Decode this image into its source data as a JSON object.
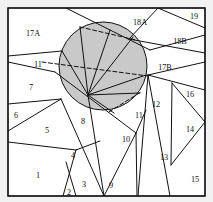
{
  "figure": {
    "type": "diagram",
    "title": "",
    "canvas": {
      "width": 213,
      "height": 202,
      "background": "#f2f2f2"
    },
    "frame": {
      "x": 8,
      "y": 8,
      "width": 197,
      "height": 188,
      "stroke": "#111111",
      "fill": "#ffffff"
    },
    "colors": {
      "line": "#111111",
      "shade_fill": "#c9c9c9",
      "page_fill": "#ffffff",
      "background": "#f2f2f2",
      "label_text": "#111111"
    },
    "shaded_region": {
      "name": "shaded-disk",
      "shape": "circle",
      "center_x": 103,
      "center_y": 66,
      "radius": 44,
      "fill": "#c9c9c9"
    },
    "fan": {
      "name": "radial-fan",
      "origin_x": 88,
      "origin_y": 95,
      "ray_endpoints": [
        [
          62,
          51
        ],
        [
          80,
          27
        ],
        [
          110,
          30
        ],
        [
          133,
          37
        ],
        [
          146,
          75
        ],
        [
          140,
          93
        ],
        [
          114,
          113
        ]
      ]
    },
    "dashed_lines": [
      {
        "name": "chord-upper",
        "x1": 80,
        "y1": 27,
        "x2": 136,
        "y2": 40
      },
      {
        "name": "chord-mid",
        "x1": 42,
        "y1": 62,
        "x2": 148,
        "y2": 76
      },
      {
        "name": "chord-lower",
        "x1": 109,
        "y1": 112,
        "x2": 141,
        "y2": 92
      }
    ],
    "labels": [
      {
        "id": "label-17A",
        "text": "17A",
        "x": 33,
        "y": 34
      },
      {
        "id": "label-18A",
        "text": "18A",
        "x": 140,
        "y": 23
      },
      {
        "id": "label-19",
        "text": "19",
        "x": 194,
        "y": 17
      },
      {
        "id": "label-18B",
        "text": "18B",
        "x": 180,
        "y": 42
      },
      {
        "id": "label-17B",
        "text": "17B",
        "x": 165,
        "y": 68
      },
      {
        "id": "label-11a",
        "text": "11",
        "x": 38,
        "y": 65
      },
      {
        "id": "label-7",
        "text": "7",
        "x": 31,
        "y": 88
      },
      {
        "id": "label-16",
        "text": "16",
        "x": 190,
        "y": 95
      },
      {
        "id": "label-12",
        "text": "12",
        "x": 156,
        "y": 105
      },
      {
        "id": "label-11b",
        "text": "11",
        "x": 139,
        "y": 116
      },
      {
        "id": "label-6",
        "text": "6",
        "x": 16,
        "y": 116
      },
      {
        "id": "label-8",
        "text": "8",
        "x": 83,
        "y": 122
      },
      {
        "id": "label-14",
        "text": "14",
        "x": 190,
        "y": 130
      },
      {
        "id": "label-5",
        "text": "5",
        "x": 47,
        "y": 131
      },
      {
        "id": "label-10",
        "text": "10",
        "x": 126,
        "y": 140
      },
      {
        "id": "label-13",
        "text": "13",
        "x": 164,
        "y": 158
      },
      {
        "id": "label-4",
        "text": "4",
        "x": 73,
        "y": 156
      },
      {
        "id": "label-1",
        "text": "1",
        "x": 38,
        "y": 176
      },
      {
        "id": "label-15",
        "text": "15",
        "x": 195,
        "y": 180
      },
      {
        "id": "label-3",
        "text": "3",
        "x": 84,
        "y": 185
      },
      {
        "id": "label-9",
        "text": "9",
        "x": 111,
        "y": 186
      },
      {
        "id": "label-2",
        "text": "2",
        "x": 69,
        "y": 193
      }
    ],
    "solid_edges": [
      {
        "name": "e-top-left-diag",
        "x1": 8,
        "y1": 8,
        "x2": 8,
        "y2": 8
      },
      {
        "name": "e1",
        "x1": 66,
        "y1": 8,
        "x2": 150,
        "y2": 50
      },
      {
        "name": "e2",
        "x1": 8,
        "y1": 56,
        "x2": 62,
        "y2": 51
      },
      {
        "name": "e3",
        "x1": 8,
        "y1": 62,
        "x2": 55,
        "y2": 72
      },
      {
        "name": "e4",
        "x1": 55,
        "y1": 72,
        "x2": 136,
        "y2": 133
      },
      {
        "name": "e5",
        "x1": 8,
        "y1": 104,
        "x2": 61,
        "y2": 99
      },
      {
        "name": "e6",
        "x1": 8,
        "y1": 131,
        "x2": 61,
        "y2": 99
      },
      {
        "name": "e7",
        "x1": 8,
        "y1": 142,
        "x2": 76,
        "y2": 150
      },
      {
        "name": "e8",
        "x1": 76,
        "y1": 150,
        "x2": 100,
        "y2": 141
      },
      {
        "name": "e9",
        "x1": 61,
        "y1": 99,
        "x2": 104,
        "y2": 196
      },
      {
        "name": "e10",
        "x1": 76,
        "y1": 150,
        "x2": 63,
        "y2": 196
      },
      {
        "name": "e11",
        "x1": 66,
        "y1": 162,
        "x2": 76,
        "y2": 196
      },
      {
        "name": "e12",
        "x1": 88,
        "y1": 95,
        "x2": 104,
        "y2": 196
      },
      {
        "name": "e13",
        "x1": 104,
        "y1": 196,
        "x2": 136,
        "y2": 133
      },
      {
        "name": "e14",
        "x1": 136,
        "y1": 133,
        "x2": 137,
        "y2": 196
      },
      {
        "name": "e15",
        "x1": 148,
        "y1": 75,
        "x2": 138,
        "y2": 196
      },
      {
        "name": "e16",
        "x1": 148,
        "y1": 75,
        "x2": 170,
        "y2": 196
      },
      {
        "name": "e17",
        "x1": 148,
        "y1": 75,
        "x2": 205,
        "y2": 90
      },
      {
        "name": "e18",
        "x1": 148,
        "y1": 75,
        "x2": 205,
        "y2": 62
      },
      {
        "name": "e19",
        "x1": 172,
        "y1": 83,
        "x2": 205,
        "y2": 122
      },
      {
        "name": "e20",
        "x1": 172,
        "y1": 83,
        "x2": 171,
        "y2": 165
      },
      {
        "name": "e21",
        "x1": 171,
        "y1": 165,
        "x2": 205,
        "y2": 122
      },
      {
        "name": "e22",
        "x1": 150,
        "y1": 50,
        "x2": 205,
        "y2": 35
      },
      {
        "name": "e23",
        "x1": 158,
        "y1": 8,
        "x2": 205,
        "y2": 28
      },
      {
        "name": "e24",
        "x1": 158,
        "y1": 8,
        "x2": 129,
        "y2": 39
      },
      {
        "name": "e25",
        "x1": 129,
        "y1": 39,
        "x2": 205,
        "y2": 53
      },
      {
        "name": "e26",
        "x1": 136,
        "y1": 133,
        "x2": 146,
        "y2": 110
      }
    ]
  }
}
